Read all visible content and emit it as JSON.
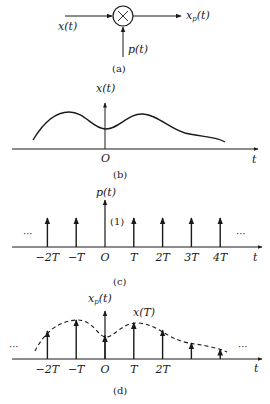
{
  "panel_a": {
    "caption": "(a)",
    "input_label": "x(t)",
    "output_label_main": "x",
    "output_label_sub": "p",
    "output_label_arg": "(t)",
    "modulator_label": "p(t)",
    "multiplier_symbol": "×",
    "multiplier_icon": "multiply-circle-icon"
  },
  "panel_b": {
    "caption": "(b)",
    "y_label": "x(t)",
    "origin_label": "O",
    "x_label": "t",
    "signal": "continuous smooth curve, peaks at t≈-1.3T and t≈1.3T, dip at t=0, decays toward right"
  },
  "panel_c": {
    "caption": "(c)",
    "y_label": "p(t)",
    "impulse_weight": "(1)",
    "x_label": "t",
    "ellipsis_left": "···",
    "ellipsis_right": "···",
    "ticks": [
      "−2T",
      "−T",
      "O",
      "T",
      "2T",
      "3T",
      "4T"
    ],
    "impulse_positions_T": [
      -2,
      -1,
      0,
      1,
      2,
      3,
      4
    ],
    "impulse_heights": [
      1,
      1,
      1,
      1,
      1,
      1,
      1
    ]
  },
  "panel_d": {
    "caption": "(d)",
    "y_label_main": "x",
    "y_label_sub": "p",
    "y_label_arg": "(t)",
    "sample_label": "x(T)",
    "x_label": "t",
    "ellipsis_left": "···",
    "ellipsis_right": "···",
    "ticks": [
      "−2T",
      "−T",
      "O",
      "T",
      "2T"
    ],
    "sample_positions_T": [
      -2,
      -1,
      0,
      1,
      2,
      3,
      4
    ],
    "sample_values_rel": [
      0.72,
      1.0,
      0.6,
      0.93,
      0.74,
      0.41,
      0.25
    ]
  }
}
